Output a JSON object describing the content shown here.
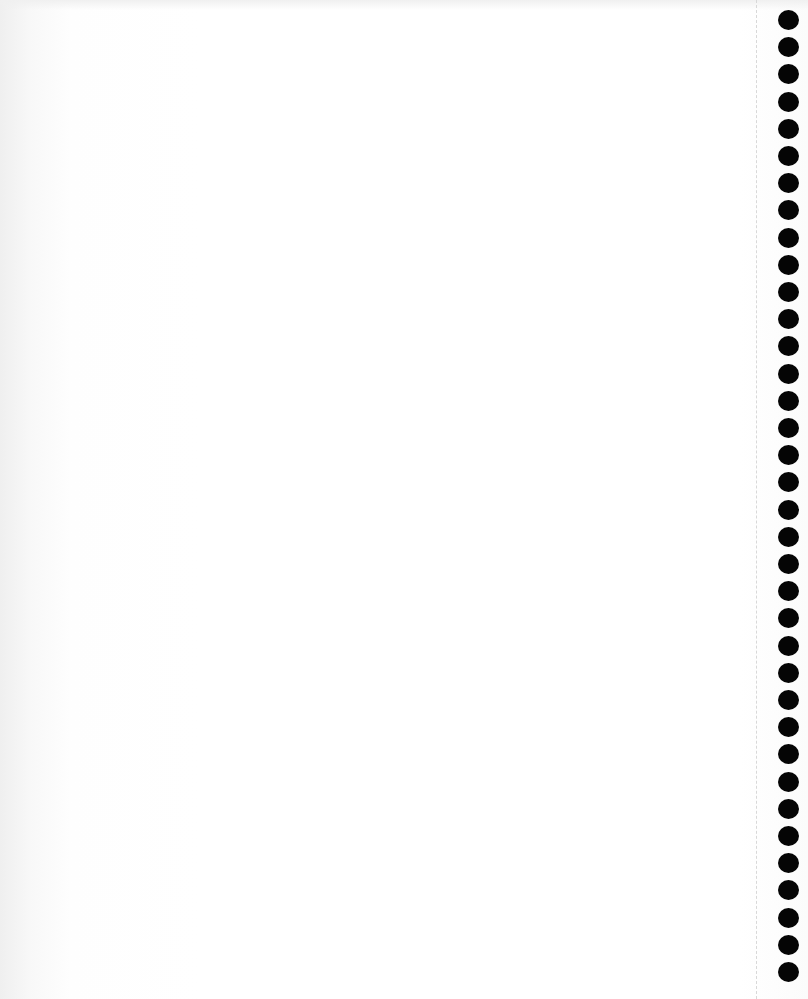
{
  "page": {
    "type": "blank notebook page",
    "text_content": "",
    "binding": {
      "hole_count": 36,
      "hole_color": "#050505",
      "first_hole_top": 10,
      "hole_spacing": 27.2,
      "perforation_color": "#d8d8d8"
    },
    "paper_color": "#ffffff"
  }
}
